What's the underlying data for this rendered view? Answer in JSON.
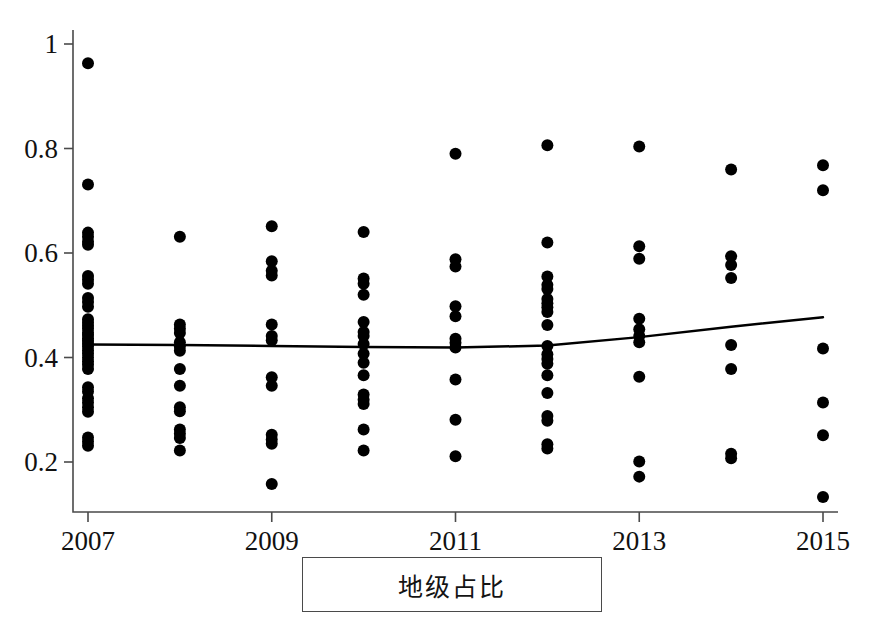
{
  "caption": {
    "label": "地级占比"
  },
  "chart_data": {
    "type": "scatter",
    "title": "",
    "subtitle": "",
    "xlabel": "",
    "ylabel": "",
    "grid": false,
    "legend": "none",
    "xlim": [
      2006.5,
      2015.5
    ],
    "ylim": [
      0.1,
      1.04
    ],
    "xticks": [
      2007,
      2009,
      2011,
      2013,
      2015
    ],
    "xtick_labels": [
      "2007",
      "2009",
      "2011",
      "2013",
      "2015"
    ],
    "yticks": [
      0.2,
      0.4,
      0.6,
      0.8,
      1
    ],
    "ytick_labels": [
      "0.2",
      "0.4",
      "0.6",
      "0.8",
      "1"
    ],
    "marker": "filled-circle",
    "marker_color": "#000000",
    "marker_size": 9,
    "trendline": {
      "type": "line",
      "color": "#000000",
      "width": 2.5,
      "x": [
        2007,
        2008,
        2009,
        2010,
        2011,
        2012,
        2013,
        2014,
        2015
      ],
      "y": [
        0.425,
        0.424,
        0.422,
        0.42,
        0.419,
        0.423,
        0.439,
        0.459,
        0.477
      ]
    },
    "series": [
      {
        "name": "地级占比",
        "points_by_year": [
          {
            "x": 2007,
            "values": [
              0.963,
              0.731,
              0.639,
              0.631,
              0.622,
              0.616,
              0.556,
              0.549,
              0.541,
              0.514,
              0.506,
              0.497,
              0.473,
              0.467,
              0.461,
              0.455,
              0.448,
              0.443,
              0.437,
              0.432,
              0.427,
              0.421,
              0.414,
              0.407,
              0.4,
              0.393,
              0.386,
              0.378,
              0.343,
              0.335,
              0.322,
              0.314,
              0.305,
              0.296,
              0.247,
              0.239,
              0.231
            ]
          },
          {
            "x": 2008,
            "values": [
              0.631,
              0.463,
              0.455,
              0.447,
              0.429,
              0.421,
              0.413,
              0.378,
              0.346,
              0.305,
              0.297,
              0.262,
              0.254,
              0.246,
              0.222
            ]
          },
          {
            "x": 2009,
            "values": [
              0.651,
              0.584,
              0.566,
              0.557,
              0.463,
              0.441,
              0.433,
              0.362,
              0.346,
              0.252,
              0.243,
              0.235,
              0.158
            ]
          },
          {
            "x": 2010,
            "values": [
              0.64,
              0.551,
              0.541,
              0.52,
              0.468,
              0.449,
              0.441,
              0.426,
              0.407,
              0.39,
              0.366,
              0.329,
              0.319,
              0.311,
              0.262,
              0.222
            ]
          },
          {
            "x": 2011,
            "values": [
              0.79,
              0.588,
              0.574,
              0.498,
              0.479,
              0.436,
              0.428,
              0.419,
              0.358,
              0.281,
              0.211
            ]
          },
          {
            "x": 2012,
            "values": [
              0.806,
              0.62,
              0.555,
              0.539,
              0.531,
              0.512,
              0.504,
              0.496,
              0.487,
              0.462,
              0.422,
              0.406,
              0.397,
              0.388,
              0.366,
              0.332,
              0.288,
              0.279,
              0.234,
              0.226
            ]
          },
          {
            "x": 2013,
            "values": [
              0.804,
              0.613,
              0.589,
              0.474,
              0.454,
              0.441,
              0.429,
              0.363,
              0.201,
              0.172
            ]
          },
          {
            "x": 2014,
            "values": [
              0.76,
              0.594,
              0.577,
              0.552,
              0.424,
              0.378,
              0.216,
              0.207
            ]
          },
          {
            "x": 2015,
            "values": [
              0.768,
              0.72,
              0.417,
              0.314,
              0.251,
              0.133
            ]
          }
        ]
      }
    ]
  },
  "axes": {
    "left_spine_color": "#4a4a4a",
    "bottom_spine_color": "#4a4a4a"
  }
}
